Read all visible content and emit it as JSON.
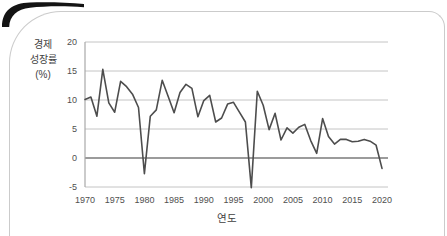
{
  "figure": {
    "background": "#ffffff",
    "border_color": "#cbcbcb",
    "corner_accent_color": "#141414"
  },
  "chart_data": {
    "type": "line",
    "xlabel": "연도",
    "ylabel": "경제 성장률 (%)",
    "ylabel_lines": [
      "경제",
      "성장률",
      "(%)"
    ],
    "x": [
      1970,
      1971,
      1972,
      1973,
      1974,
      1975,
      1976,
      1977,
      1978,
      1979,
      1980,
      1981,
      1982,
      1983,
      1984,
      1985,
      1986,
      1987,
      1988,
      1989,
      1990,
      1991,
      1992,
      1993,
      1994,
      1995,
      1996,
      1997,
      1998,
      1999,
      2000,
      2001,
      2002,
      2003,
      2004,
      2005,
      2006,
      2007,
      2008,
      2009,
      2010,
      2011,
      2012,
      2013,
      2014,
      2015,
      2016,
      2017,
      2018,
      2019,
      2020
    ],
    "values": [
      10.1,
      10.5,
      7.2,
      15.3,
      9.5,
      7.9,
      13.2,
      12.3,
      11.0,
      8.7,
      -2.7,
      7.2,
      8.3,
      13.4,
      10.6,
      7.8,
      11.3,
      12.7,
      12.0,
      7.1,
      9.9,
      10.8,
      6.2,
      6.9,
      9.3,
      9.6,
      7.9,
      6.2,
      -5.1,
      11.5,
      9.1,
      4.9,
      7.7,
      3.1,
      5.2,
      4.3,
      5.3,
      5.8,
      3.0,
      0.8,
      6.8,
      3.7,
      2.4,
      3.2,
      3.2,
      2.8,
      2.9,
      3.2,
      2.9,
      2.2,
      -1.8
    ],
    "xticks": [
      1970,
      1975,
      1980,
      1985,
      1990,
      1995,
      2000,
      2005,
      2010,
      2015,
      2020
    ],
    "yticks": [
      20,
      15,
      10,
      5,
      0,
      -5
    ],
    "xlim": [
      1970,
      2020
    ],
    "ylim": [
      -5,
      20
    ],
    "grid": true,
    "legend": "none",
    "line_color": "#4d4d4d",
    "grid_color": "#c4c4c4",
    "zero_line_color": "#7a7a7a",
    "axis_color": "#a8a8a8",
    "tick_color": "#4f4f4f"
  }
}
